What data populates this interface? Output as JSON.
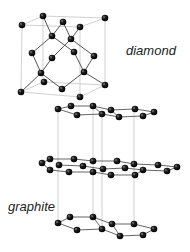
{
  "labels": {
    "diamond": "diamond",
    "graphite": "graphite"
  },
  "colors": {
    "atom": "#111111",
    "bond": "#555555",
    "frame": "#bbbbbb",
    "text": "#222222"
  },
  "diamond": {
    "frame_lines": [
      [
        22,
        25,
        80,
        27
      ],
      [
        22,
        25,
        43,
        16
      ],
      [
        43,
        16,
        105,
        18
      ],
      [
        80,
        27,
        105,
        18
      ],
      [
        22,
        25,
        21,
        92
      ],
      [
        80,
        27,
        80,
        97
      ],
      [
        105,
        18,
        105,
        85
      ],
      [
        43,
        16,
        43,
        82
      ],
      [
        21,
        92,
        80,
        97
      ],
      [
        80,
        97,
        105,
        85
      ],
      [
        21,
        92,
        43,
        82
      ],
      [
        43,
        82,
        105,
        85
      ]
    ],
    "bonds": [
      [
        43,
        16,
        52,
        36
      ],
      [
        63,
        22,
        52,
        36
      ],
      [
        63,
        22,
        71,
        39
      ],
      [
        80,
        27,
        71,
        39
      ],
      [
        52,
        36,
        32,
        53
      ],
      [
        52,
        36,
        74,
        52
      ],
      [
        71,
        39,
        52,
        58
      ],
      [
        71,
        39,
        94,
        56
      ],
      [
        32,
        53,
        41,
        73
      ],
      [
        52,
        58,
        41,
        73
      ],
      [
        74,
        52,
        84,
        72
      ],
      [
        94,
        56,
        84,
        72
      ],
      [
        41,
        73,
        21,
        92
      ],
      [
        41,
        73,
        62,
        89
      ],
      [
        84,
        72,
        62,
        89
      ],
      [
        84,
        72,
        105,
        85
      ]
    ],
    "atoms": [
      [
        22,
        25
      ],
      [
        43,
        16
      ],
      [
        63,
        22
      ],
      [
        80,
        27
      ],
      [
        105,
        18
      ],
      [
        52,
        36
      ],
      [
        71,
        39
      ],
      [
        32,
        53
      ],
      [
        52,
        58
      ],
      [
        74,
        52
      ],
      [
        94,
        56
      ],
      [
        41,
        73
      ],
      [
        84,
        72
      ],
      [
        44,
        82
      ],
      [
        62,
        89
      ],
      [
        21,
        92
      ],
      [
        105,
        85
      ],
      [
        80,
        97
      ]
    ]
  },
  "graphite": {
    "verticals": [
      [
        58,
        109,
        58,
        223
      ],
      [
        93,
        106,
        93,
        217
      ],
      [
        102,
        114,
        102,
        229
      ],
      [
        134,
        109,
        134,
        224
      ]
    ],
    "layers": [
      {
        "bonds": [
          [
            58,
            109,
            71,
            106
          ],
          [
            71,
            106,
            93,
            106
          ],
          [
            93,
            106,
            111,
            110
          ],
          [
            111,
            110,
            135,
            109
          ],
          [
            135,
            109,
            154,
            112
          ],
          [
            154,
            112,
            143,
            116
          ],
          [
            143,
            116,
            119,
            117
          ],
          [
            119,
            117,
            102,
            114
          ],
          [
            102,
            114,
            77,
            115
          ],
          [
            77,
            115,
            58,
            109
          ],
          [
            93,
            106,
            102,
            114
          ],
          [
            111,
            110,
            119,
            117
          ]
        ],
        "atoms": [
          [
            58,
            109
          ],
          [
            71,
            106
          ],
          [
            77,
            115
          ],
          [
            93,
            106
          ],
          [
            102,
            114
          ],
          [
            111,
            110
          ],
          [
            119,
            117
          ],
          [
            135,
            109
          ],
          [
            143,
            116
          ],
          [
            154,
            112
          ]
        ]
      },
      {
        "bonds": [
          [
            42,
            163,
            50,
            159
          ],
          [
            50,
            159,
            74,
            159
          ],
          [
            74,
            159,
            93,
            161
          ],
          [
            93,
            161,
            117,
            161
          ],
          [
            117,
            161,
            134,
            164
          ],
          [
            134,
            164,
            158,
            165
          ],
          [
            158,
            165,
            177,
            167
          ],
          [
            177,
            167,
            167,
            171
          ],
          [
            167,
            171,
            143,
            170
          ],
          [
            143,
            170,
            135,
            175
          ],
          [
            135,
            175,
            111,
            175
          ],
          [
            111,
            175,
            93,
            172
          ],
          [
            93,
            172,
            69,
            172
          ],
          [
            69,
            172,
            50,
            170
          ],
          [
            50,
            170,
            42,
            163
          ],
          [
            59,
            165,
            83,
            166
          ],
          [
            83,
            166,
            103,
            169
          ],
          [
            103,
            169,
            125,
            168
          ],
          [
            125,
            168,
            143,
            170
          ]
        ],
        "atoms": [
          [
            42,
            163
          ],
          [
            50,
            159
          ],
          [
            59,
            165
          ],
          [
            50,
            170
          ],
          [
            69,
            172
          ],
          [
            74,
            159
          ],
          [
            83,
            166
          ],
          [
            93,
            161
          ],
          [
            93,
            172
          ],
          [
            103,
            169
          ],
          [
            111,
            175
          ],
          [
            117,
            161
          ],
          [
            125,
            168
          ],
          [
            134,
            164
          ],
          [
            135,
            175
          ],
          [
            143,
            170
          ],
          [
            158,
            165
          ],
          [
            167,
            171
          ],
          [
            177,
            167
          ]
        ]
      },
      {
        "bonds": [
          [
            58,
            223,
            70,
            217
          ],
          [
            70,
            217,
            93,
            217
          ],
          [
            93,
            217,
            112,
            224
          ],
          [
            112,
            224,
            134,
            224
          ],
          [
            134,
            224,
            154,
            229
          ],
          [
            154,
            229,
            143,
            235
          ],
          [
            143,
            235,
            120,
            236
          ],
          [
            120,
            236,
            102,
            229
          ],
          [
            102,
            229,
            77,
            230
          ],
          [
            77,
            230,
            58,
            223
          ],
          [
            93,
            217,
            102,
            229
          ],
          [
            112,
            224,
            120,
            236
          ]
        ],
        "atoms": [
          [
            58,
            223
          ],
          [
            70,
            217
          ],
          [
            77,
            230
          ],
          [
            93,
            217
          ],
          [
            102,
            229
          ],
          [
            112,
            224
          ],
          [
            120,
            236
          ],
          [
            134,
            224
          ],
          [
            143,
            235
          ],
          [
            154,
            229
          ]
        ]
      }
    ]
  }
}
